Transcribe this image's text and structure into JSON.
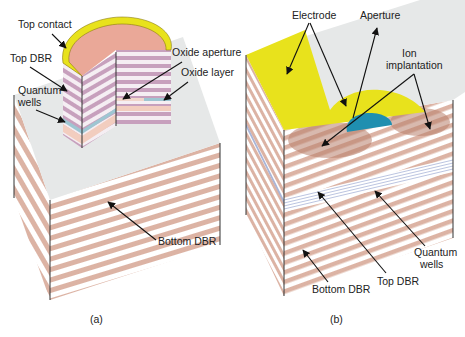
{
  "figure": {
    "panels": [
      {
        "id": "a",
        "caption": "(a)",
        "title": "Oxide-confined VCSEL",
        "labels": {
          "top_contact": "Top contact",
          "top_dbr": "Top DBR",
          "quantum_wells_line1": "Quantum",
          "quantum_wells_line2": "wells",
          "oxide_aperture": "Oxide aperture",
          "oxide_layer": "Oxide layer",
          "bottom_dbr": "Bottom DBR"
        }
      },
      {
        "id": "b",
        "caption": "(b)",
        "title": "Ion-implanted VCSEL",
        "labels": {
          "electrode": "Electrode",
          "aperture": "Aperture",
          "ion_implantation_line1": "Ion",
          "ion_implantation_line2": "implantation",
          "quantum_wells_line1": "Quantum",
          "quantum_wells_line2": "wells",
          "top_dbr": "Top DBR",
          "bottom_dbr": "Bottom DBR"
        }
      }
    ],
    "colors": {
      "dbr_stripe": "#dcb3a4",
      "top_dbr_stripe": "#c7a0bd",
      "substrate_top": "#e6e8e8",
      "contact_gold": "#e8e21c",
      "contact_pink": "#eaa898",
      "aperture_blue": "#1f8fb0",
      "quantum_well": "#9ec6d2",
      "quantum_well_b": "#a9b5d8",
      "implant": "#b87f6c"
    }
  }
}
